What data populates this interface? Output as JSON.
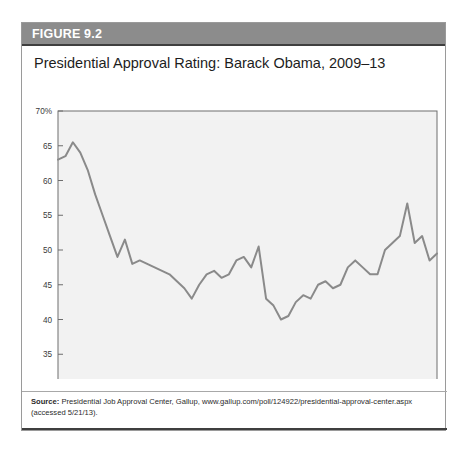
{
  "figure": {
    "label": "FIGURE 9.2",
    "title": "Presidential Approval Rating: Barack Obama, 2009–13",
    "source_label": "Source:",
    "source_text": " Presidential Job Approval Center, Gallup, www.gallup.com/poll/124922/presidential-approval-center.aspx (accessed 5/21/13).",
    "header_bg": "#8c8c8c",
    "line_color": "#8a8a8a",
    "plot_bg": "#f2f2f2",
    "axis_color": "#6e6e6e"
  },
  "chart_data": {
    "type": "line",
    "title": "Presidential Approval Rating: Barack Obama, 2009–13",
    "xlabel": "",
    "ylabel": "",
    "ylim": [
      30,
      70
    ],
    "ytick_values": [
      70,
      65,
      60,
      55,
      50,
      45,
      40,
      35,
      30
    ],
    "ytick_labels": [
      "70%",
      "65",
      "60",
      "55",
      "50",
      "45",
      "40",
      "35",
      "30"
    ],
    "xtick_labels": [
      "Feb 09",
      "Aug 09",
      "Feb 10",
      "Aug 10",
      "Feb 11",
      "Aug 11",
      "Feb 12",
      "Aug 12",
      "Feb 13",
      "May 13"
    ],
    "xtick_positions": [
      0,
      6,
      12,
      18,
      24,
      30,
      36,
      42,
      48,
      51
    ],
    "grid": false,
    "legend": "none",
    "x_unit": "months since Feb 2009",
    "x_range": [
      0,
      51
    ],
    "series": [
      {
        "name": "Approval rating (%)",
        "x": [
          0,
          1,
          2,
          3,
          4,
          5,
          6,
          7,
          8,
          9,
          10,
          11,
          12,
          13,
          14,
          15,
          16,
          17,
          18,
          19,
          20,
          21,
          22,
          23,
          24,
          25,
          26,
          27,
          28,
          29,
          30,
          31,
          32,
          33,
          34,
          35,
          36,
          37,
          38,
          39,
          40,
          41,
          42,
          43,
          44,
          45,
          46,
          47,
          48,
          49,
          50,
          51
        ],
        "values": [
          63.0,
          63.5,
          65.5,
          64.0,
          61.5,
          58.0,
          55.0,
          52.0,
          49.0,
          51.5,
          48.0,
          48.5,
          48.0,
          47.5,
          47.0,
          46.5,
          45.5,
          44.5,
          43.0,
          45.0,
          46.5,
          47.0,
          46.0,
          46.5,
          48.5,
          49.0,
          47.5,
          50.5,
          43.0,
          42.0,
          40.0,
          40.5,
          42.5,
          43.5,
          43.0,
          45.0,
          45.5,
          44.5,
          45.0,
          47.5,
          48.5,
          47.5,
          46.5,
          46.5,
          50.0,
          51.0,
          52.0,
          56.7,
          51.0,
          52.0,
          48.5,
          49.5
        ]
      }
    ]
  }
}
